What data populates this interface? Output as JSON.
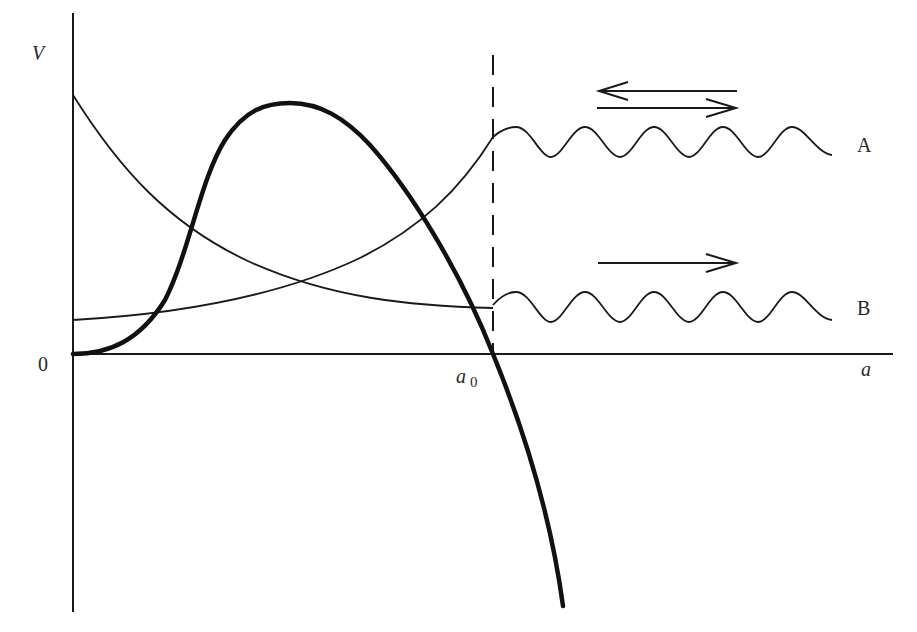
{
  "figure": {
    "type": "potential-energy diagram",
    "axes": {
      "y_label": "V",
      "x_label": "a",
      "origin_label": "0",
      "marker_label_main": "a",
      "marker_label_sub": "0"
    },
    "curves": [
      {
        "name": "decreasing-potential-curve",
        "description": "thin curve decreasing from high V at a=0 to low value at a0",
        "style": "thin"
      },
      {
        "name": "increasing-potential-curve",
        "description": "thin curve increasing from low V at a=0 to higher value at a0",
        "style": "thin"
      },
      {
        "name": "barrier-potential-curve",
        "description": "thick curve rising from origin to a maximum, then falling through zero at a0 and diverging negative",
        "style": "thick"
      }
    ],
    "dashed_line": {
      "position": "a0",
      "style": "dashed vertical"
    },
    "waves": [
      {
        "id": "A",
        "label": "A",
        "arrows": [
          "left",
          "right"
        ],
        "description": "oscillation continuing from increasing curve with incident and reflected waves"
      },
      {
        "id": "B",
        "label": "B",
        "arrows": [
          "right"
        ],
        "description": "oscillation continuing from decreasing curve with outgoing wave only"
      }
    ],
    "colors": {
      "ink": "#1a1a1a",
      "background": "#ffffff"
    }
  }
}
